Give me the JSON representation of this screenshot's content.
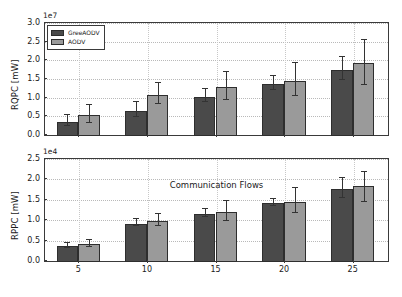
{
  "figure": {
    "background": "#ffffff",
    "series_colors": {
      "GreeAODV": "#4a4a4a",
      "AODV": "#9a9a9a"
    }
  },
  "legend": {
    "entries": [
      {
        "label": "GreeAODV",
        "color": "#4a4a4a"
      },
      {
        "label": "AODV",
        "color": "#9a9a9a"
      }
    ]
  },
  "xaxis": {
    "label": "Communication Flows",
    "ticks": [
      "5",
      "10",
      "15",
      "20",
      "25"
    ]
  },
  "top": {
    "ylabel": "RQPC [mW]",
    "exponent": "1e7",
    "yticks": [
      "0.0",
      "0.5",
      "1.0",
      "1.5",
      "2.0",
      "2.5",
      "3.0"
    ]
  },
  "bottom": {
    "ylabel": "RPPC [mW]",
    "exponent": "1e4",
    "yticks": [
      "0.0",
      "0.5",
      "1.0",
      "1.5",
      "2.0",
      "2.5"
    ]
  },
  "chart_data": [
    {
      "type": "bar",
      "title": "",
      "subplot": "top",
      "xlabel": "",
      "ylabel": "RQPC [mW]",
      "y_exponent": "1e7",
      "ylim": [
        0,
        3.0
      ],
      "yticks": [
        0.0,
        0.5,
        1.0,
        1.5,
        2.0,
        2.5,
        3.0
      ],
      "grid": true,
      "legend_position": "upper left",
      "categories": [
        "5",
        "10",
        "15",
        "20",
        "25"
      ],
      "series": [
        {
          "name": "GreeAODV",
          "color": "#4a4a4a",
          "values": [
            0.38,
            0.68,
            1.05,
            1.39,
            1.78
          ],
          "errors_low": [
            0.15,
            0.21,
            0.17,
            0.18,
            0.31
          ],
          "errors_high": [
            0.15,
            0.21,
            0.17,
            0.18,
            0.31
          ]
        },
        {
          "name": "AODV",
          "color": "#9a9a9a",
          "values": [
            0.56,
            1.11,
            1.32,
            1.48,
            1.96
          ],
          "errors_low": [
            0.24,
            0.27,
            0.37,
            0.44,
            0.62
          ],
          "errors_high": [
            0.24,
            0.27,
            0.37,
            0.44,
            0.58
          ]
        }
      ]
    },
    {
      "type": "bar",
      "title": "",
      "subplot": "bottom",
      "xlabel": "Communication Flows",
      "ylabel": "RPPC [mW]",
      "y_exponent": "1e4",
      "ylim": [
        0,
        2.5
      ],
      "yticks": [
        0.0,
        0.5,
        1.0,
        1.5,
        2.0,
        2.5
      ],
      "grid": true,
      "legend_position": "none",
      "categories": [
        "5",
        "10",
        "15",
        "20",
        "25"
      ],
      "series": [
        {
          "name": "GreeAODV",
          "color": "#4a4a4a",
          "values": [
            0.39,
            0.94,
            1.18,
            1.44,
            1.79
          ],
          "errors_low": [
            0.06,
            0.09,
            0.1,
            0.09,
            0.24
          ],
          "errors_high": [
            0.06,
            0.09,
            0.1,
            0.09,
            0.24
          ]
        },
        {
          "name": "AODV",
          "color": "#9a9a9a",
          "values": [
            0.43,
            1.0,
            1.22,
            1.48,
            1.87
          ],
          "errors_low": [
            0.08,
            0.14,
            0.24,
            0.31,
            0.43
          ],
          "errors_high": [
            0.08,
            0.14,
            0.24,
            0.31,
            0.31
          ]
        }
      ]
    }
  ]
}
